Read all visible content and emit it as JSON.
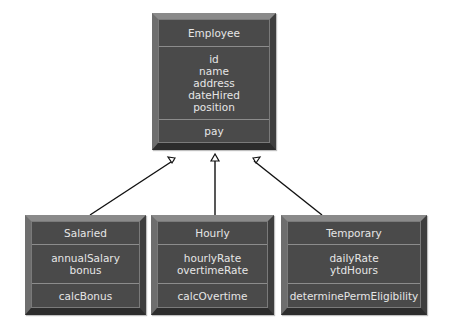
{
  "diagram": {
    "type": "uml-class-inheritance",
    "superclass": {
      "name": "Employee",
      "attributes": [
        "id",
        "name",
        "address",
        "dateHired",
        "position"
      ],
      "methods": [
        "pay"
      ]
    },
    "subclasses": [
      {
        "name": "Salaried",
        "attributes": [
          "annualSalary",
          "bonus"
        ],
        "methods": [
          "calcBonus"
        ]
      },
      {
        "name": "Hourly",
        "attributes": [
          "hourlyRate",
          "overtimeRate"
        ],
        "methods": [
          "calcOvertime"
        ]
      },
      {
        "name": "Temporary",
        "attributes": [
          "dailyRate",
          "ytdHours"
        ],
        "methods": [
          "determinePermEligibility"
        ]
      }
    ],
    "relationship": "generalization",
    "colors": {
      "box": "#4a4a4a",
      "text": "#e6e6e6",
      "bevel_light": "#8a8a8a",
      "bevel_dark": "#2c2c2c",
      "line": "#000000"
    }
  }
}
